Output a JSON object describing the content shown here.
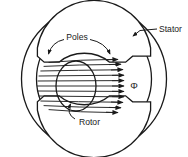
{
  "figure": {
    "type": "cross-section-diagram",
    "background_color": "#ffffff",
    "line_color": "#1a1a1a",
    "width": 188,
    "height": 157
  },
  "labels": {
    "stator": "Stator",
    "poles": "Poles",
    "rotor": "Rotor",
    "flux_symbol": "Φ"
  },
  "parts": {
    "stator": {
      "name": "Stator",
      "description": "outer annular ring",
      "outer_radius": 72,
      "inner_radius": 57,
      "center_x": 94,
      "center_y": 79
    },
    "poles": {
      "name": "Poles",
      "description": "two salient pole shoes, left and right, with stepped pole faces",
      "count": 2,
      "arc_outer_radius": 50,
      "arc_inner_radius": 35
    },
    "rotor": {
      "name": "Rotor",
      "description": "central circular armature",
      "radius_x": 19,
      "radius_y": 24,
      "center_x": 76,
      "center_y": 86
    },
    "flux": {
      "symbol": "Φ",
      "description": "magnetic flux lines crossing the air gap from left pole through rotor to right pole, arrowheads on the right",
      "line_count": 11,
      "arrow_direction": "right"
    }
  },
  "annotations": [
    {
      "id": "stator-callout",
      "label": "Stator",
      "target": "outer stator ring",
      "leader": "straight line from label leftward-down to the stator ring"
    },
    {
      "id": "poles-callout",
      "label": "Poles",
      "target": "both pole shoes",
      "leader": "two curved arrows, one to the left pole and one to the right pole"
    },
    {
      "id": "rotor-callout",
      "label": "Rotor",
      "target": "central rotor circle",
      "leader": "curved arrow from label upward to the rotor"
    }
  ],
  "colors": {
    "ink": "#1a1a1a",
    "paper": "#ffffff"
  }
}
